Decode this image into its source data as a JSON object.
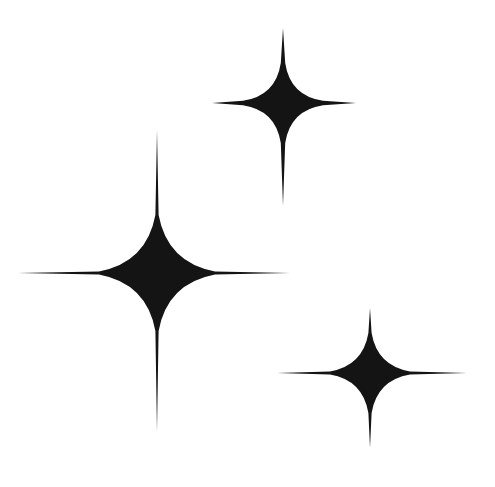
{
  "image": {
    "description": "Three four-pointed sparkle stars",
    "background": "#ffffff",
    "fill": "#141414",
    "width": 495,
    "height": 487
  },
  "stars": [
    {
      "name": "large-star",
      "cx": 157,
      "cy": 273,
      "top": 130,
      "bottom": 432,
      "left": 18,
      "right": 290,
      "body": 58,
      "needle": 1.6
    },
    {
      "name": "top-right-star",
      "cx": 283,
      "cy": 103,
      "top": 28,
      "bottom": 206,
      "left": 212,
      "right": 356,
      "body": 40,
      "needle": 2.2
    },
    {
      "name": "bottom-right-star",
      "cx": 370,
      "cy": 373,
      "top": 308,
      "bottom": 448,
      "left": 277,
      "right": 467,
      "body": 40,
      "needle": 1.6
    }
  ]
}
